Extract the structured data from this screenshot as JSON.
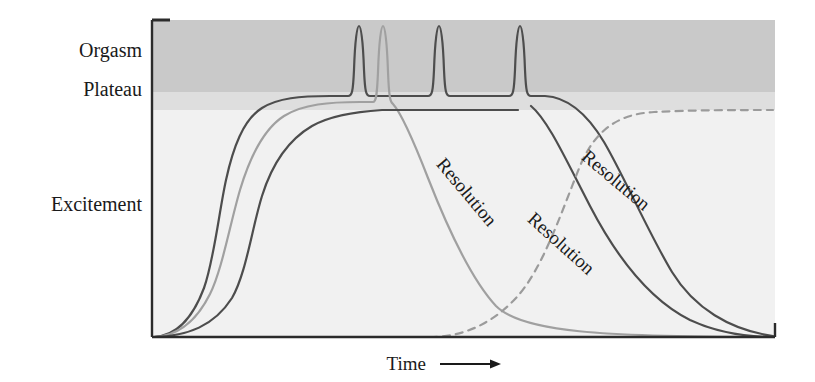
{
  "figure": {
    "background_color": "#ffffff",
    "width": 815,
    "height": 382
  },
  "axes": {
    "y_labels": [
      {
        "text": "Orgasm",
        "y": 57
      },
      {
        "text": "Plateau",
        "y": 96
      },
      {
        "text": "Excitement",
        "y": 211
      }
    ],
    "x_label": "Time",
    "x_arrow_icon": "right-arrow-icon",
    "axis_color": "#2b2b2b",
    "plot_left": 152,
    "plot_right": 775,
    "plot_top": 20,
    "plot_bottom": 337
  },
  "bands": [
    {
      "name": "Orgasm",
      "color": "#c9c9c9",
      "y_top": 20,
      "y_bottom": 92
    },
    {
      "name": "Plateau",
      "color": "#dedede",
      "y_top": 92,
      "y_bottom": 110
    },
    {
      "name": "Excitement",
      "color": "#f1f1f1",
      "y_top": 110,
      "y_bottom": 337
    }
  ],
  "annotations": [
    {
      "text": "Resolution",
      "x": 462,
      "y": 196,
      "rotation": 50,
      "color": "#4a4a4a"
    },
    {
      "text": "Resolution",
      "x": 557,
      "y": 248,
      "rotation": 42,
      "color": "#3a3a3a"
    },
    {
      "text": "Resolution",
      "x": 612,
      "y": 185,
      "rotation": 40,
      "color": "#3a3a3a"
    }
  ],
  "chart_data": {
    "type": "line",
    "title": "",
    "xlabel": "Time",
    "ylabel": "",
    "xlim": [
      0,
      100
    ],
    "ylim": [
      0,
      100
    ],
    "grid": false,
    "legend": "none",
    "y_category_bands": [
      "Excitement",
      "Plateau",
      "Orgasm"
    ],
    "annotations": [
      "Resolution",
      "Resolution",
      "Resolution"
    ],
    "series": [
      {
        "name": "Pattern A (multiple orgasms)",
        "color": "#4d4d4d",
        "width": 2.2,
        "dashed": false,
        "description": "Rises to plateau, three successive orgasmic spikes, then gradual resolution",
        "peak_count": 3,
        "peaks_x": [
          358,
          437,
          518
        ],
        "path": "M 154 337 C 176 336 192 320 204 288 C 214 260 219 212 226 180 C 233 148 243 120 262 108 C 278 98 300 96 330 96 L 348 96 C 352 96 353 92 354 70 C 355 40 357 26 359 26 C 361 26 363 40 364 70 C 365 92 366 96 370 96 L 428 96 C 432 96 433 92 434 70 C 435 40 437 26 439 26 C 441 26 443 40 444 70 C 445 92 446 96 450 96 L 509 96 C 513 96 514 92 515 70 C 516 40 518 26 520 26 C 522 26 524 40 525 70 C 526 92 527 96 531 96 L 545 96 C 566 97 586 112 604 142 C 624 176 648 232 672 272 C 694 308 730 330 773 336"
      },
      {
        "name": "Pattern B (single orgasm, quick resolution)",
        "color": "#a0a0a0",
        "width": 2.2,
        "dashed": false,
        "description": "Rises to plateau, one orgasmic spike, then steep rapid resolution to baseline",
        "peak_count": 1,
        "peaks_x": [
          382
        ],
        "path": "M 154 337 C 178 336 196 322 210 294 C 222 270 230 224 240 190 C 249 160 262 130 284 116 C 303 104 330 102 360 102 L 373 102 C 376 102 377 96 378 72 C 379 42 381 26 383 26 C 385 26 387 42 388 72 C 389 96 390 102 393 104 C 402 114 414 142 428 178 C 446 224 470 278 496 306 C 522 332 600 337 773 337"
      },
      {
        "name": "Pattern C (plateau without orgasm, then orgasm and resolution)",
        "color": "#4d4d4d",
        "width": 2.2,
        "dashed": false,
        "description": "Slowest rise to plateau level, one orgasmic spike, then slow resolution",
        "peak_count": 1,
        "peaks_x": [
          437
        ],
        "path": "M 154 337 C 188 336 214 326 232 298 C 246 274 252 228 262 196 C 272 164 288 140 312 126 C 330 116 352 112 382 110 L 518 110"
      },
      {
        "name": "Pattern C resolution (slow)",
        "color": "#4d4d4d",
        "width": 2.2,
        "dashed": false,
        "description": "Long slow decline to baseline after orgasm",
        "path": "M 531 106 C 548 120 566 160 590 206 C 616 256 650 300 690 320 C 720 334 748 337 774 337"
      },
      {
        "name": "Refractory rebound (dashed)",
        "color": "#9b9b9b",
        "width": 2.2,
        "dashed": true,
        "description": "Dashed curve showing a second arousal cycle rising back to plateau",
        "path": "M 430 337 C 460 337 490 326 516 298 C 542 270 560 216 580 166 C 596 128 620 114 654 112 C 692 110 740 110 773 110"
      }
    ]
  }
}
